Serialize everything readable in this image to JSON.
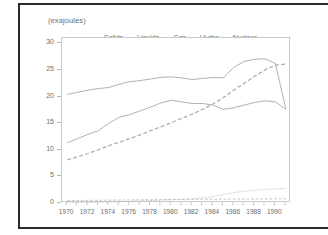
{
  "chart_data": {
    "type": "line",
    "title": "(exajoules)",
    "xlabel": "",
    "ylabel": "",
    "xlim": [
      1969.5,
      1991.5
    ],
    "ylim": [
      0,
      31
    ],
    "yticks": [
      0,
      5,
      10,
      15,
      20,
      25,
      30
    ],
    "xticks": [
      1970,
      1972,
      1974,
      1976,
      1978,
      1980,
      1982,
      1984,
      1986,
      1988,
      1990
    ],
    "grid": false,
    "legend_position": "top-inside",
    "x": [
      1970,
      1971,
      1972,
      1973,
      1974,
      1975,
      1976,
      1977,
      1978,
      1979,
      1980,
      1981,
      1982,
      1983,
      1984,
      1985,
      1986,
      1987,
      1988,
      1989,
      1990,
      1991
    ],
    "series": [
      {
        "name": "Solids",
        "style": "solid",
        "color": "#a8a8a8",
        "values": [
          20.4,
          20.8,
          21.2,
          21.5,
          21.7,
          22.3,
          22.8,
          23.0,
          23.3,
          23.6,
          23.7,
          23.5,
          23.2,
          23.4,
          23.6,
          23.5,
          25.5,
          26.6,
          27.0,
          27.1,
          26.2,
          17.7
        ]
      },
      {
        "name": "Liquids",
        "style": "solid",
        "color": "#a8a8a8",
        "values": [
          11.3,
          12.1,
          12.9,
          13.6,
          15.0,
          16.1,
          16.6,
          17.3,
          18.0,
          18.8,
          19.3,
          19.0,
          18.7,
          18.7,
          18.4,
          17.6,
          17.9,
          18.4,
          18.9,
          19.2,
          19.0,
          17.6
        ]
      },
      {
        "name": "Gas",
        "style": "dashed",
        "color": "#b0b0b0",
        "values": [
          8.1,
          8.7,
          9.3,
          10.0,
          10.8,
          11.4,
          12.1,
          12.8,
          13.6,
          14.3,
          15.1,
          15.9,
          16.7,
          17.6,
          18.6,
          19.8,
          21.2,
          22.5,
          23.8,
          25.0,
          25.9,
          26.1
        ]
      },
      {
        "name": "Hydro",
        "style": "dashdot",
        "color": "#bdbdbd",
        "values": [
          0.45,
          0.47,
          0.5,
          0.52,
          0.55,
          0.57,
          0.58,
          0.6,
          0.62,
          0.64,
          0.66,
          0.67,
          0.68,
          0.7,
          0.72,
          0.73,
          0.74,
          0.75,
          0.76,
          0.77,
          0.78,
          0.78
        ]
      },
      {
        "name": "Nuclear",
        "style": "dotted",
        "color": "#b5b5b5",
        "values": [
          0.05,
          0.07,
          0.09,
          0.12,
          0.16,
          0.22,
          0.3,
          0.38,
          0.46,
          0.55,
          0.62,
          0.7,
          0.8,
          0.95,
          1.2,
          1.6,
          1.95,
          2.2,
          2.4,
          2.55,
          2.65,
          2.7
        ]
      }
    ]
  }
}
